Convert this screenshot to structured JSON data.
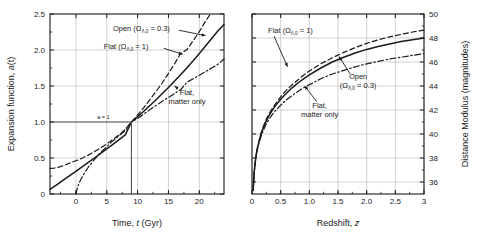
{
  "figure": {
    "background_color": "#ffffff",
    "line_color": "#1a1a1a",
    "grid_color": "#b4b4b4"
  },
  "chart_data": [
    {
      "id": "left",
      "type": "line",
      "title": "",
      "xlabel": "Time, t  (Gyr)",
      "xlabel_parts": {
        "pre": "Time, ",
        "italic": "t",
        "post": "  (Gyr)"
      },
      "ylabel": "Expansion  function, a(t)",
      "ylabel_parts": {
        "pre": "Expansion  function, ",
        "italic": "a",
        "post": "(t)"
      },
      "xlim": [
        -4.2,
        24.0
      ],
      "ylim": [
        0.0,
        2.5
      ],
      "xticks": [
        0,
        5,
        10,
        15,
        20
      ],
      "xticklabels": [
        "0",
        "5",
        "10",
        "15",
        "20"
      ],
      "yticks": [
        0.0,
        0.5,
        1.0,
        1.5,
        2.0,
        2.5
      ],
      "yticklabels": [
        "0",
        "0.5",
        "1.0",
        "1.5",
        "2.0",
        "2.5"
      ],
      "grid": true,
      "legend_position": "inline-annotations",
      "reference_lines": [
        {
          "name": "a-equals-one",
          "label": "a = 1",
          "a_value": 1.0,
          "t_value": 9.0
        }
      ],
      "annotations": [
        {
          "name": "open-label",
          "text": "Open (Ω",
          "sub": "Λ,0",
          "tail": " = 0.3)",
          "x": 6.0,
          "y": 2.26
        },
        {
          "name": "flat-lambda-label",
          "text": "Flat (Ω",
          "sub": "Λ,0",
          "tail": " = 1)",
          "x": 4.5,
          "y": 2.01
        },
        {
          "name": "flat-matter-label",
          "line1": "Flat,",
          "line2": "matter only",
          "x": 18.0,
          "y": 1.38
        }
      ],
      "series": [
        {
          "name": "Flat (ΩΛ,0 = 1)",
          "style": "dashed",
          "x": [
            -4.2,
            -3.5,
            -3.0,
            -2.5,
            -2.0,
            -1.5,
            -1.0,
            -0.5,
            0.0,
            0.5,
            1.0,
            2.0,
            3.0,
            4.0,
            5.0,
            6.0,
            7.0,
            8.0,
            9.0,
            10.0,
            11.0,
            12.0,
            13.0,
            14.0,
            15.0,
            16.0,
            17.0,
            18.0,
            19.0,
            20.0,
            21.0,
            21.8
          ],
          "y": [
            0.355,
            0.36,
            0.368,
            0.38,
            0.395,
            0.412,
            0.43,
            0.447,
            0.462,
            0.478,
            0.497,
            0.54,
            0.588,
            0.64,
            0.697,
            0.757,
            0.82,
            0.9,
            1.0,
            1.098,
            1.2,
            1.31,
            1.425,
            1.545,
            1.675,
            1.81,
            1.955,
            2.005,
            2.13,
            2.255,
            2.4,
            2.5
          ]
        },
        {
          "name": "Open (ΩΛ,0 = 0.3)",
          "style": "solid",
          "x": [
            -4.2,
            -3.5,
            -3.0,
            -2.0,
            -1.0,
            0.0,
            1.0,
            2.0,
            3.0,
            4.0,
            5.0,
            6.0,
            7.0,
            8.0,
            9.0,
            10.0,
            11.0,
            12.0,
            13.0,
            14.0,
            15.0,
            16.0,
            17.0,
            18.0,
            19.0,
            20.0,
            21.0,
            22.0,
            23.0,
            24.0
          ],
          "y": [
            0.063,
            0.105,
            0.135,
            0.195,
            0.255,
            0.315,
            0.376,
            0.438,
            0.5,
            0.563,
            0.626,
            0.69,
            0.755,
            0.822,
            1.0,
            1.075,
            1.15,
            1.23,
            1.31,
            1.395,
            1.48,
            1.57,
            1.66,
            1.755,
            1.85,
            1.95,
            2.055,
            2.16,
            2.265,
            2.355
          ]
        },
        {
          "name": "Flat, matter only",
          "style": "dash-dot",
          "x": [
            0.0,
            0.3,
            0.6,
            1.0,
            1.5,
            2.0,
            3.0,
            4.0,
            5.0,
            6.0,
            7.0,
            8.0,
            9.0,
            10.0,
            11.0,
            12.0,
            13.0,
            14.0,
            15.0,
            16.0,
            17.0,
            18.0,
            19.0,
            20.0,
            21.0,
            22.0,
            23.0,
            24.0
          ],
          "y": [
            0.0,
            0.105,
            0.168,
            0.235,
            0.308,
            0.372,
            0.48,
            0.575,
            0.66,
            0.738,
            0.812,
            0.88,
            1.0,
            1.048,
            1.11,
            1.172,
            1.23,
            1.288,
            1.342,
            1.397,
            1.45,
            1.553,
            1.6,
            1.648,
            1.7,
            1.75,
            1.8,
            1.875
          ]
        }
      ]
    },
    {
      "id": "right",
      "type": "line",
      "title": "",
      "xlabel": "Redshift, z",
      "xlabel_parts": {
        "pre": "Redshift, ",
        "italic": "z",
        "post": ""
      },
      "ylabel": "Distance Modulus (magnitudes)",
      "xlim": [
        0.0,
        3.0
      ],
      "ylim": [
        35.0,
        50.0
      ],
      "xticks": [
        0,
        0.5,
        1.0,
        1.5,
        2.0,
        2.5,
        3.0
      ],
      "xticklabels": [
        "0",
        "0.5",
        "1.0",
        "1.5",
        "2.0",
        "2.5",
        "3"
      ],
      "yticks": [
        36,
        38,
        40,
        42,
        44,
        46,
        48,
        50
      ],
      "yticklabels": [
        "36",
        "38",
        "40",
        "42",
        "44",
        "46",
        "48",
        "50"
      ],
      "y_axis_side": "right",
      "grid": true,
      "legend_position": "inline-annotations",
      "annotations": [
        {
          "name": "flat-lambda-label",
          "text": "Flat (Ω",
          "sub": "Λ,0",
          "tail": " = 1)",
          "x": 0.28,
          "y": 48.4
        },
        {
          "name": "open-label",
          "line1": "Open",
          "line2_pre": "(Ω",
          "line2_sub": "Λ,0",
          "line2_tail": " = 0.3)",
          "x": 1.85,
          "y": 44.6
        },
        {
          "name": "flat-matter-label",
          "line1": "Flat,",
          "line2": "matter only",
          "x": 1.18,
          "y": 42.2
        }
      ],
      "series": [
        {
          "name": "Flat (ΩΛ,0 = 1)",
          "style": "dashed",
          "x": [
            0.02,
            0.04,
            0.06,
            0.08,
            0.1,
            0.14,
            0.18,
            0.22,
            0.26,
            0.3,
            0.35,
            0.4,
            0.5,
            0.6,
            0.7,
            0.8,
            0.9,
            1.0,
            1.2,
            1.4,
            1.6,
            1.8,
            2.0,
            2.2,
            2.4,
            2.6,
            2.8,
            3.0
          ],
          "y": [
            35.3,
            36.9,
            37.8,
            38.5,
            39.0,
            39.8,
            40.4,
            40.9,
            41.35,
            41.7,
            42.1,
            42.45,
            43.1,
            43.65,
            44.1,
            44.5,
            44.9,
            45.25,
            45.85,
            46.35,
            46.8,
            47.2,
            47.55,
            47.85,
            48.1,
            48.3,
            48.5,
            48.65
          ]
        },
        {
          "name": "Open (ΩΛ,0 = 0.3)",
          "style": "solid",
          "x": [
            0.02,
            0.04,
            0.06,
            0.08,
            0.1,
            0.14,
            0.18,
            0.22,
            0.26,
            0.3,
            0.35,
            0.4,
            0.5,
            0.6,
            0.7,
            0.8,
            0.9,
            1.0,
            1.2,
            1.4,
            1.6,
            1.8,
            2.0,
            2.2,
            2.4,
            2.6,
            2.8,
            3.0
          ],
          "y": [
            35.3,
            36.9,
            37.8,
            38.45,
            38.95,
            39.7,
            40.3,
            40.8,
            41.2,
            41.55,
            41.95,
            42.3,
            42.9,
            43.4,
            43.85,
            44.25,
            44.6,
            44.92,
            45.5,
            46.0,
            46.4,
            46.75,
            47.05,
            47.3,
            47.5,
            47.7,
            47.85,
            48.0
          ]
        },
        {
          "name": "Flat, matter only",
          "style": "dash-dot",
          "x": [
            0.02,
            0.04,
            0.06,
            0.08,
            0.1,
            0.14,
            0.18,
            0.22,
            0.26,
            0.3,
            0.35,
            0.4,
            0.5,
            0.6,
            0.7,
            0.8,
            0.9,
            1.0,
            1.2,
            1.4,
            1.6,
            1.8,
            2.0,
            2.2,
            2.4,
            2.6,
            2.8,
            3.0
          ],
          "y": [
            35.3,
            36.85,
            37.75,
            38.4,
            38.85,
            39.55,
            40.1,
            40.55,
            40.95,
            41.25,
            41.6,
            41.9,
            42.4,
            42.85,
            43.2,
            43.55,
            43.85,
            44.1,
            44.6,
            45.0,
            45.3,
            45.6,
            45.85,
            46.05,
            46.25,
            46.4,
            46.55,
            46.7
          ]
        }
      ]
    }
  ]
}
